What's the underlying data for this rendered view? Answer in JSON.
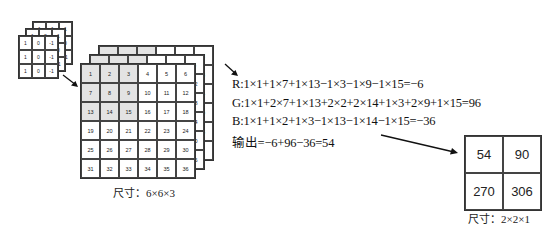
{
  "kernel": {
    "layers": [
      {
        "name": "B",
        "values": [
          "1",
          "1",
          "1",
          "0",
          "0",
          "0",
          "-1",
          "-1",
          "-1"
        ]
      },
      {
        "name": "G",
        "values": [
          "1",
          "2",
          "1",
          "0",
          "0",
          "0",
          "-1",
          "-2",
          "-1"
        ]
      },
      {
        "name": "R",
        "values": [
          "1",
          "0",
          "-1",
          "1",
          "0",
          "-1",
          "1",
          "0",
          "-1"
        ]
      }
    ]
  },
  "input": {
    "front_values": [
      "1",
      "2",
      "3",
      "4",
      "5",
      "6",
      "7",
      "8",
      "9",
      "10",
      "11",
      "12",
      "13",
      "14",
      "15",
      "16",
      "17",
      "18",
      "19",
      "20",
      "21",
      "22",
      "23",
      "24",
      "25",
      "26",
      "27",
      "28",
      "29",
      "30",
      "31",
      "32",
      "33",
      "34",
      "35",
      "36"
    ],
    "layer2_right_col": [
      "6",
      "12",
      "18",
      "24",
      "30",
      "36"
    ],
    "layer3_right_col": [
      "2",
      "8",
      "4",
      "0",
      "6",
      ""
    ],
    "caption": "尺寸：6×6×3"
  },
  "equations": {
    "r": "R:1×1+1×7+1×13−1×3−1×9−1×15=−6",
    "g": "G:1×1+2×7+1×13+2×2+2×14+1×3+2×9+1×15=96",
    "b": "B:1×1+1×2+1×3−1×13−1×14−1×15=−36",
    "out": "输出=−6+96−36=54"
  },
  "output": {
    "values": [
      "54",
      "90",
      "270",
      "306"
    ],
    "caption": "尺寸：2×2×1"
  }
}
